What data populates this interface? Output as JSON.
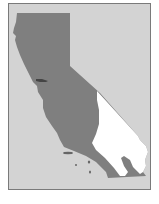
{
  "map": {
    "subject": "California",
    "regions": [
      {
        "name": "highlighted-region",
        "color": "#7f7f7f"
      },
      {
        "name": "unhighlighted-region",
        "color": "#ffffff"
      }
    ],
    "background_color": "#d3d3d3",
    "border_color": "#7a7a7a"
  }
}
